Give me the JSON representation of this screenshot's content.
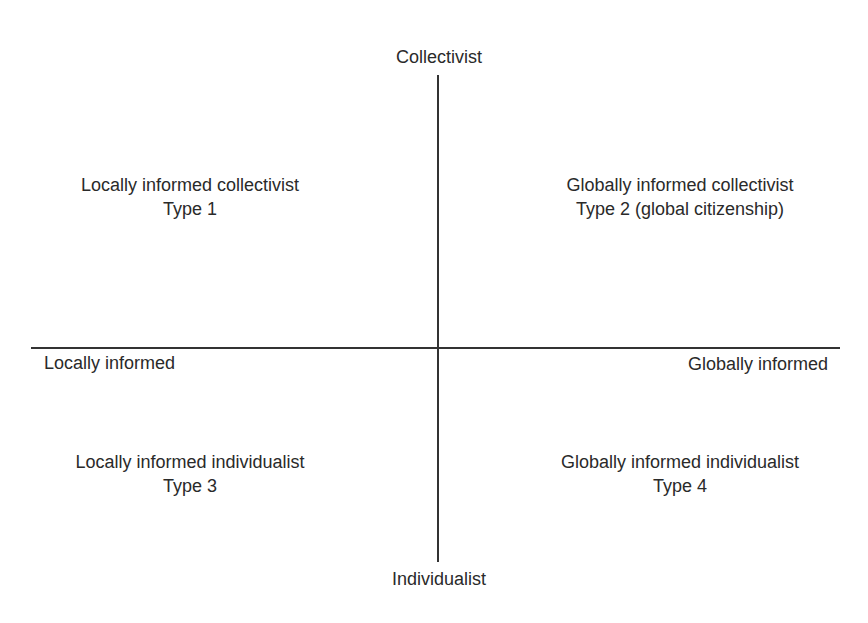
{
  "diagram": {
    "type": "quadrant",
    "axes": {
      "vertical": {
        "top_label": "Collectivist",
        "bottom_label": "Individualist"
      },
      "horizontal": {
        "left_label": "Locally informed",
        "right_label": "Globally informed"
      }
    },
    "quadrants": [
      {
        "position": "top-left",
        "title": "Locally informed collectivist",
        "type_label": "Type 1"
      },
      {
        "position": "top-right",
        "title": "Globally informed collectivist",
        "type_label": "Type 2 (global citizenship)"
      },
      {
        "position": "bottom-left",
        "title": "Locally informed individualist",
        "type_label": "Type 3"
      },
      {
        "position": "bottom-right",
        "title": "Globally informed individualist",
        "type_label": "Type 4"
      }
    ],
    "colors": {
      "line": "#333333",
      "text": "#2a2a2a",
      "background": "#ffffff"
    }
  }
}
